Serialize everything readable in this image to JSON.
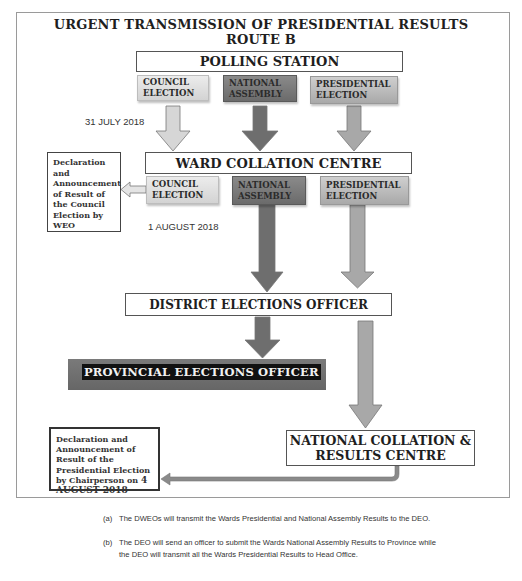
{
  "title": {
    "line1": "URGENT TRANSMISSION OF PRESIDENTIAL RESULTS",
    "line2": "ROUTE B"
  },
  "polling_station": {
    "label": "POLLING STATION",
    "elections": [
      {
        "line1": "COUNCIL",
        "line2": "ELECTION",
        "color": "#dcdcdc"
      },
      {
        "line1": "NATIONAL",
        "line2": "ASSEMBLY",
        "color": "#767676"
      },
      {
        "line1": "PRESIDENTIAL",
        "line2": "ELECTION",
        "color": "#b8b8b8"
      }
    ],
    "date": "31 JULY 2018"
  },
  "ward_collation": {
    "label": "WARD COLLATION CENTRE",
    "elections": [
      {
        "line1": "COUNCIL",
        "line2": "ELECTION"
      },
      {
        "line1": "NATIONAL",
        "line2": "ASSEMBLY"
      },
      {
        "line1": "PRESIDENTIAL",
        "line2": "ELECTION"
      }
    ],
    "date": "1 AUGUST 2018",
    "council_declaration": "Declaration and Announcement of Result of the Council Election by WEO"
  },
  "district": {
    "label": "DISTRICT ELECTIONS OFFICER"
  },
  "provincial": {
    "label": "PROVINCIAL ELECTIONS OFFICER"
  },
  "national_centre": {
    "line1": "NATIONAL COLLATION &",
    "line2": "RESULTS CENTRE"
  },
  "presidential_declaration": {
    "text": "Declaration and Announcement of Result of the Presidential Election by Chairperson",
    "date_prefix": "on ",
    "date": "4 AUGUST 2018"
  },
  "notes": [
    {
      "marker": "(a)",
      "text": "The DWEOs will transmit the Wards Presidential and National Assembly Results to the DEO."
    },
    {
      "marker": "(b)",
      "text": "The DEO will send an officer to submit the Wards National Assembly Results to Province while the DEO will transmit all the Wards Presidential Results to Head Office."
    }
  ],
  "colors": {
    "council_arrow": "#d6d6d6",
    "national_arrow": "#6e6e6e",
    "presidential_arrow": "#a8a8a8",
    "provincial_bar": "#707070",
    "frame": "#9a9a9a"
  }
}
